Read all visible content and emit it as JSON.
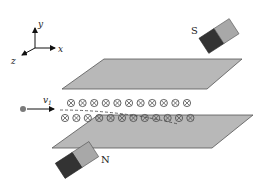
{
  "diagram": {
    "axes": {
      "x_label": "x",
      "y_label": "y",
      "z_label": "z"
    },
    "particle": {
      "velocity_label": "v",
      "velocity_subscript": "1"
    },
    "magnets": {
      "top_pole_label": "S",
      "bottom_pole_label": "N"
    },
    "field": {
      "symbol": "⊗",
      "direction": "into page",
      "top_row_count": 11,
      "bottom_row_count": 12
    },
    "colors": {
      "plate_fill": "#b8b8b8",
      "plate_stroke": "#555555",
      "magnet_dark": "#333333",
      "magnet_light": "#a8a8a8",
      "particle": "#7a7a7a",
      "field_symbol": "#555555"
    }
  }
}
